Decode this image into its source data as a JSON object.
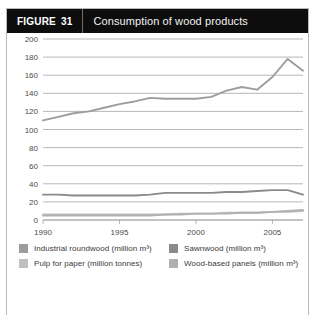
{
  "figure": {
    "tag_label": "FIGURE",
    "number": "31",
    "title": "Consumption of wood products"
  },
  "colors": {
    "header_bg": "#0d0d0d",
    "header_text": "#f2f2f2",
    "border": "#b9b9b9",
    "gridline": "#9a9a9a",
    "axis_text": "#4a4a4a",
    "industrial_roundwood": "#9d9d9d",
    "sawnwood": "#8a8a8a",
    "pulp_for_paper": "#c0c0c0",
    "wood_based_panels": "#b0b0b0"
  },
  "legend": {
    "items": [
      {
        "label": "Industrial roundwood (million m³)",
        "color": "#9d9d9d"
      },
      {
        "label": "Sawnwood (million m³)",
        "color": "#8a8a8a"
      },
      {
        "label": "Pulp for paper (million tonnes)",
        "color": "#c0c0c0"
      },
      {
        "label": "Wood-based panels (million m³)",
        "color": "#b0b0b0"
      }
    ]
  },
  "chart_data": {
    "type": "line",
    "title": "Consumption of wood products",
    "xlabel": "",
    "ylabel": "",
    "xlim": [
      1990,
      2007
    ],
    "ylim": [
      0,
      200
    ],
    "ytick_step": 20,
    "yticks": [
      0,
      20,
      40,
      60,
      80,
      100,
      120,
      140,
      160,
      180,
      200
    ],
    "xticks": [
      1990,
      1995,
      2000,
      2005
    ],
    "x": [
      1990,
      1991,
      1992,
      1993,
      1994,
      1995,
      1996,
      1997,
      1998,
      1999,
      2000,
      2001,
      2002,
      2003,
      2004,
      2005,
      2006,
      2007
    ],
    "grid": true,
    "legend_position": "bottom",
    "series": [
      {
        "name": "Industrial roundwood (million m³)",
        "unit": "million m³",
        "color": "#9d9d9d",
        "values": [
          110,
          114,
          118,
          120,
          124,
          128,
          131,
          135,
          134,
          134,
          134,
          136,
          143,
          147,
          144,
          158,
          178,
          165
        ]
      },
      {
        "name": "Sawnwood (million m³)",
        "unit": "million m³",
        "color": "#8a8a8a",
        "values": [
          28,
          28,
          27,
          27,
          27,
          27,
          27,
          28,
          30,
          30,
          30,
          30,
          31,
          31,
          32,
          33,
          33,
          28
        ]
      },
      {
        "name": "Pulp for paper (million tonnes)",
        "unit": "million tonnes",
        "color": "#c0c0c0",
        "values": [
          6,
          6,
          6,
          6,
          6,
          6,
          6,
          6,
          6,
          7,
          7,
          7,
          8,
          8,
          8,
          9,
          9,
          10
        ]
      },
      {
        "name": "Wood-based panels (million m³)",
        "unit": "million m³",
        "color": "#b0b0b0",
        "values": [
          5,
          5,
          5,
          5,
          5,
          5,
          5,
          5,
          6,
          6,
          7,
          7,
          7,
          8,
          8,
          9,
          10,
          11
        ]
      }
    ]
  }
}
